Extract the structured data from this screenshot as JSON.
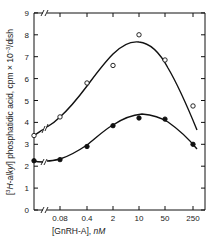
{
  "chart_data": {
    "type": "line",
    "title": "",
    "xlabel": "[GnRH-A], nM",
    "ylabel": "[3H-alkyl] phosphatidic acid, cpm × 10^-3/dish",
    "x_scale": "log (with axis break before 0.08; first point is control/zero)",
    "categories": [
      "0",
      "0.08",
      "0.4",
      "2",
      "10",
      "50",
      "250"
    ],
    "x_tick_labels": [
      "0.08",
      "0.4",
      "2",
      "10",
      "50",
      "250"
    ],
    "y_ticks": [
      0,
      1,
      2,
      3,
      4,
      5,
      6,
      7,
      8,
      9
    ],
    "ylim": [
      0,
      9
    ],
    "grid": false,
    "legend": null,
    "series": [
      {
        "name": "open circles",
        "marker": "open-circle",
        "values": [
          3.4,
          4.25,
          5.8,
          6.6,
          8.0,
          6.85,
          4.75
        ],
        "fit_curve_peak": 7.5
      },
      {
        "name": "filled circles",
        "marker": "filled-circle",
        "values": [
          2.25,
          2.3,
          2.9,
          3.85,
          4.2,
          4.15,
          3.0
        ],
        "fit_curve_peak": 4.4
      }
    ]
  },
  "labels": {
    "xlabel_main": "[GnRH-A], ",
    "xlabel_unit": "nM",
    "ylabel_pre": "[",
    "ylabel_sup": "3",
    "ylabel_italic": "H-alkyl",
    "ylabel_post": "] phosphatidic acid, cpm × 10",
    "ylabel_exp": "−3",
    "ylabel_tail": "/dish"
  },
  "style": {
    "ink": "#111111",
    "background": "#ffffff"
  }
}
